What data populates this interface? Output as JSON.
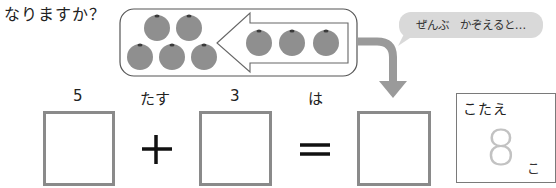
{
  "question": {
    "text_tail": "なりますか？"
  },
  "illustration": {
    "left_group_count": 5,
    "right_group_count": 3,
    "arrow_direction": "left",
    "speech_bubble": "ぜんぶ　かぞえると…",
    "colors": {
      "orange_fill": "#8f8f8f",
      "orange_stem": "#3a3a3a",
      "container_border": "#555555",
      "arrow_gray": "#9a9a9a",
      "bubble_bg": "#d9d9d9"
    }
  },
  "equation": {
    "labels": {
      "first_number": "5",
      "plus_word": "たす",
      "second_number": "3",
      "equals_word": "は"
    },
    "boxes": [
      {
        "id": "first",
        "value": ""
      },
      {
        "id": "second",
        "value": ""
      },
      {
        "id": "result",
        "value": ""
      }
    ],
    "operators": [
      "+",
      "="
    ]
  },
  "answer": {
    "title": "こたえ",
    "value": "8",
    "unit": "こ"
  }
}
